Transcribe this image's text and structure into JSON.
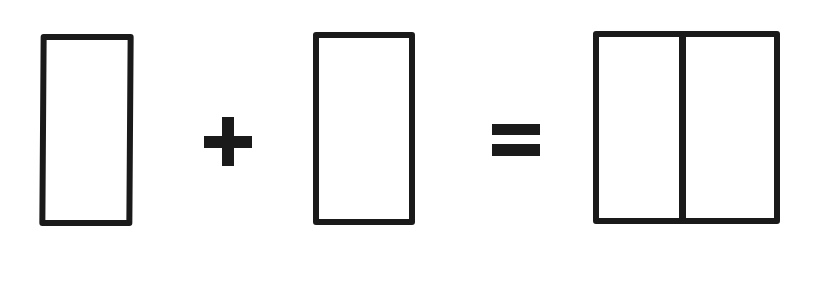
{
  "diagram": {
    "colors": {
      "stroke": "#1a1a1a",
      "background": "#ffffff"
    },
    "elements": [
      {
        "id": "rect-left",
        "type": "rectangle",
        "label": "rectangle"
      },
      {
        "id": "plus",
        "type": "operator",
        "symbol": "+"
      },
      {
        "id": "rect-middle",
        "type": "rectangle",
        "label": "rectangle"
      },
      {
        "id": "equals",
        "type": "operator",
        "symbol": "="
      },
      {
        "id": "rect-combined",
        "type": "rectangle-divided",
        "label": "two rectangles joined"
      }
    ]
  }
}
